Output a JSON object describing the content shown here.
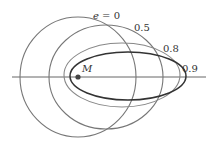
{
  "diagram": {
    "focus": {
      "label": "M",
      "cx": 78,
      "cy": 77,
      "color": "#444444"
    },
    "axis": {
      "x1": 12,
      "x2": 206,
      "y": 77,
      "color": "#555555"
    },
    "curves": [
      {
        "label": "e = 0",
        "cx": 78,
        "cy": 77,
        "rx": 58,
        "ry": 60,
        "stroke": "#777777",
        "width": 1.1,
        "label_x": 93,
        "label_y": 19
      },
      {
        "label": "0.5",
        "cx": 106,
        "cy": 77,
        "rx": 57,
        "ry": 52,
        "stroke": "#777777",
        "width": 1.1,
        "label_x": 134,
        "label_y": 31
      },
      {
        "label": "0.8",
        "cx": 122,
        "cy": 75,
        "rx": 58,
        "ry": 32,
        "stroke": "#888888",
        "width": 1.1,
        "label_x": 163,
        "label_y": 52
      },
      {
        "label": "0.9",
        "cx": 128,
        "cy": 76,
        "rx": 58,
        "ry": 24,
        "stroke": "#333333",
        "width": 1.5,
        "label_x": 182,
        "label_y": 72
      }
    ]
  }
}
